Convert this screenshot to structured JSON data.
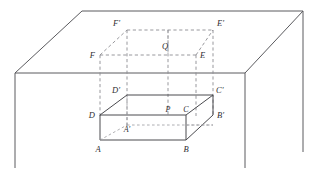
{
  "figure": {
    "type": "geometry-diagram",
    "canvas": {
      "width": 318,
      "height": 170
    },
    "colors": {
      "background": "#ffffff",
      "solid_stroke": "#4b4b4f",
      "room_stroke": "#5a5a5e",
      "dashed_stroke": "#8d8d92",
      "label_fill": "#2e2e32"
    },
    "room": {
      "name": "floor-and-wall-outline",
      "ceiling_top_edge": {
        "x1": 82,
        "y1": 11,
        "x2": 303,
        "y2": 11
      },
      "left_diagonal": {
        "x1": 82,
        "y1": 11,
        "x2": 15,
        "y2": 73
      },
      "right_diagonal": {
        "x1": 303,
        "y1": 11,
        "x2": 245,
        "y2": 73
      },
      "floor_back_edge": {
        "x1": 15,
        "y1": 73,
        "x2": 245,
        "y2": 73
      },
      "left_vertical": {
        "x1": 15,
        "y1": 73,
        "x2": 15,
        "y2": 168
      },
      "right_vertical": {
        "x1": 245,
        "y1": 73,
        "x2": 245,
        "y2": 168
      },
      "far_right_vertical": {
        "x1": 303,
        "y1": 11,
        "x2": 303,
        "y2": 152
      }
    },
    "box": {
      "name": "solid-rectangular-box",
      "front_top_left": {
        "x": 100,
        "y": 115
      },
      "front_top_right": {
        "x": 186,
        "y": 115
      },
      "front_bottom_left": {
        "x": 100,
        "y": 140
      },
      "front_bottom_right": {
        "x": 186,
        "y": 140
      },
      "back_top_left": {
        "x": 127,
        "y": 95
      },
      "back_top_right": {
        "x": 213,
        "y": 95
      },
      "back_bottom_right": {
        "x": 213,
        "y": 115
      },
      "back_bottom_left": {
        "x": 127,
        "y": 125
      }
    },
    "cube": {
      "name": "dashed-cube-above",
      "front_top_left": {
        "x": 100,
        "y": 55
      },
      "front_top_right": {
        "x": 196,
        "y": 55
      },
      "back_top_left": {
        "x": 127,
        "y": 30
      },
      "back_top_right": {
        "x": 213,
        "y": 30
      }
    },
    "labels": [
      {
        "id": "F-prime",
        "text": "F′",
        "x": 120,
        "y": 26,
        "anchor": "end"
      },
      {
        "id": "E-prime",
        "text": "E′",
        "x": 217,
        "y": 26,
        "anchor": "start"
      },
      {
        "id": "F",
        "text": "F",
        "x": 95,
        "y": 58,
        "anchor": "end"
      },
      {
        "id": "Q",
        "text": "Q",
        "x": 165,
        "y": 49,
        "anchor": "middle"
      },
      {
        "id": "E",
        "text": "E",
        "x": 200,
        "y": 58,
        "anchor": "start"
      },
      {
        "id": "D-prime",
        "text": "D′",
        "x": 120,
        "y": 93,
        "anchor": "end"
      },
      {
        "id": "C-prime",
        "text": "C′",
        "x": 216,
        "y": 93,
        "anchor": "start"
      },
      {
        "id": "D",
        "text": "D",
        "x": 95,
        "y": 118,
        "anchor": "end"
      },
      {
        "id": "P",
        "text": "P",
        "x": 168,
        "y": 112,
        "anchor": "middle"
      },
      {
        "id": "C",
        "text": "C",
        "x": 186,
        "y": 112,
        "anchor": "middle"
      },
      {
        "id": "B-prime",
        "text": "B′",
        "x": 217,
        "y": 118,
        "anchor": "start"
      },
      {
        "id": "A-prime",
        "text": "A′",
        "x": 127,
        "y": 132,
        "anchor": "middle"
      },
      {
        "id": "A",
        "text": "A",
        "x": 98,
        "y": 152,
        "anchor": "middle"
      },
      {
        "id": "B",
        "text": "B",
        "x": 186,
        "y": 152,
        "anchor": "middle"
      }
    ]
  }
}
